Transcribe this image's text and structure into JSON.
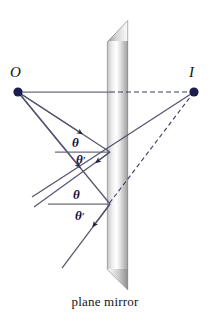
{
  "figure": {
    "caption": "plane mirror",
    "points": [
      {
        "id": "object",
        "label": "O",
        "x": 18,
        "y": 92,
        "label_x": 10,
        "label_y": 68
      },
      {
        "id": "image",
        "label": "I",
        "x": 194,
        "y": 92,
        "label_x": 190,
        "label_y": 68
      }
    ],
    "angle_labels": [
      {
        "id": "theta-upper-incident",
        "text": "θ",
        "prime": "",
        "x": 72,
        "y": 142
      },
      {
        "id": "theta-prime-upper-reflected",
        "text": "θ",
        "prime": "′",
        "x": 76,
        "y": 158
      },
      {
        "id": "theta-lower-incident",
        "text": "θ",
        "prime": "",
        "x": 73,
        "y": 194
      },
      {
        "id": "theta-prime-lower-reflected",
        "text": "θ",
        "prime": "′",
        "x": 75,
        "y": 214
      }
    ],
    "mirror": {
      "name": "plane-mirror-bar",
      "left_x": 107,
      "right_x": 128,
      "top_y": 20,
      "bottom_y": 290,
      "bevel": 22
    },
    "reflection_points": [
      {
        "id": "upper-reflection-point",
        "x": 110,
        "y": 152
      },
      {
        "id": "lower-reflection-point",
        "x": 110,
        "y": 204
      }
    ],
    "colors": {
      "dot": "#1c1c4e",
      "ray": "#55556e",
      "normal": "#6b6b80",
      "dashed": "#3a3a5c",
      "mirror_light": "#ffffff",
      "mirror_mid": "#d8d8d8",
      "mirror_dark": "#9a9a9a",
      "caption_text": "#141414"
    }
  }
}
